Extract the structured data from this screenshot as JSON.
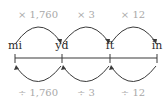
{
  "diagram": {
    "units": [
      {
        "label": "mi",
        "x": 15
      },
      {
        "label": "yd",
        "x": 62
      },
      {
        "label": "ft",
        "x": 110
      },
      {
        "label": "in",
        "x": 157
      }
    ],
    "multiply_ops": [
      {
        "label": "× 1,760",
        "from": "mi",
        "to": "yd"
      },
      {
        "label": "× 3",
        "from": "yd",
        "to": "ft"
      },
      {
        "label": "× 12",
        "from": "ft",
        "to": "in"
      }
    ],
    "divide_ops": [
      {
        "label": "÷ 1,760",
        "from": "yd",
        "to": "mi"
      },
      {
        "label": "÷ 3",
        "from": "ft",
        "to": "yd"
      },
      {
        "label": "÷ 12",
        "from": "in",
        "to": "ft"
      }
    ],
    "colors": {
      "op_text": "#a8a8a8",
      "unit_text": "#2a2a2a",
      "stroke": "#3a3a3a"
    }
  }
}
